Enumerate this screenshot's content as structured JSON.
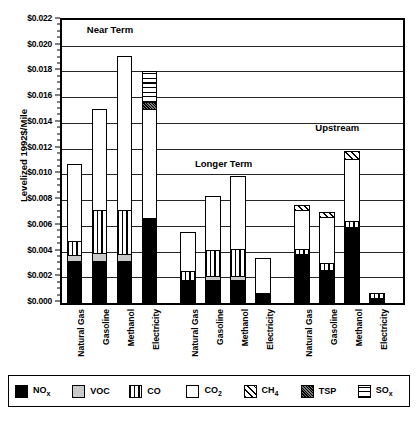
{
  "chart_data": {
    "type": "bar",
    "subtype": "stacked",
    "title": "",
    "xlabel": "",
    "ylabel": "Levelized 1992$/Mile",
    "ylim": [
      0,
      0.022
    ],
    "ytick_step": 0.002,
    "ytick_labels": [
      "$0.000",
      "$0.002",
      "$0.004",
      "$0.006",
      "$0.008",
      "$0.010",
      "$0.012",
      "$0.014",
      "$0.016",
      "$0.018",
      "$0.020",
      "$0.022"
    ],
    "ytick_values": [
      0,
      0.002,
      0.004,
      0.006,
      0.008,
      0.01,
      0.012,
      0.014,
      0.016,
      0.018,
      0.02,
      0.022
    ],
    "grid": true,
    "grid_axis": "y",
    "legend_position": "bottom",
    "categories": [
      "Natural Gas",
      "Gasoline",
      "Methanol",
      "Electricity"
    ],
    "group_labels": [
      "Near Term",
      "Longer Term",
      "Upstream"
    ],
    "series_names": [
      "NOx",
      "VOC",
      "CO",
      "CO2",
      "CH4",
      "TSP",
      "SOx"
    ],
    "series_labels": [
      "NOₓ",
      "VOC",
      "CO",
      "CO₂",
      "CH₄",
      "TSP",
      "SOₓ"
    ],
    "groups": [
      {
        "name": "Near Term",
        "bars": [
          {
            "category": "Natural Gas",
            "total": 0.0108,
            "segments": [
              {
                "series": "NOx",
                "value": 0.0033
              },
              {
                "series": "VOC",
                "value": 0.0004
              },
              {
                "series": "CO",
                "value": 0.0011
              },
              {
                "series": "CO2",
                "value": 0.006
              }
            ]
          },
          {
            "category": "Gasoline",
            "total": 0.0151,
            "segments": [
              {
                "series": "NOx",
                "value": 0.0033
              },
              {
                "series": "VOC",
                "value": 0.0006
              },
              {
                "series": "CO",
                "value": 0.0033
              },
              {
                "series": "CO2",
                "value": 0.0079
              }
            ]
          },
          {
            "category": "Methanol",
            "total": 0.0192,
            "segments": [
              {
                "series": "NOx",
                "value": 0.0033
              },
              {
                "series": "VOC",
                "value": 0.0005
              },
              {
                "series": "CO",
                "value": 0.0034
              },
              {
                "series": "CO2",
                "value": 0.012
              }
            ]
          },
          {
            "category": "Electricity",
            "total": 0.018,
            "segments": [
              {
                "series": "NOx",
                "value": 0.0066
              },
              {
                "series": "CO2",
                "value": 0.0085
              },
              {
                "series": "TSP",
                "value": 0.0005
              },
              {
                "series": "SOx",
                "value": 0.0024
              }
            ]
          }
        ]
      },
      {
        "name": "Longer Term",
        "bars": [
          {
            "category": "Natural Gas",
            "total": 0.0055,
            "segments": [
              {
                "series": "NOx",
                "value": 0.0018
              },
              {
                "series": "CO",
                "value": 0.0007
              },
              {
                "series": "CO2",
                "value": 0.003
              }
            ]
          },
          {
            "category": "Gasoline",
            "total": 0.0083,
            "segments": [
              {
                "series": "NOx",
                "value": 0.0018
              },
              {
                "series": "VOC",
                "value": 0.0003
              },
              {
                "series": "CO",
                "value": 0.002
              },
              {
                "series": "CO2",
                "value": 0.0042
              }
            ]
          },
          {
            "category": "Methanol",
            "total": 0.0099,
            "segments": [
              {
                "series": "NOx",
                "value": 0.0018
              },
              {
                "series": "VOC",
                "value": 0.0003
              },
              {
                "series": "CO",
                "value": 0.0021
              },
              {
                "series": "CO2",
                "value": 0.0057
              }
            ]
          },
          {
            "category": "Electricity",
            "total": 0.0035,
            "segments": [
              {
                "series": "NOx",
                "value": 0.0008
              },
              {
                "series": "CO2",
                "value": 0.0027
              }
            ]
          }
        ]
      },
      {
        "name": "Upstream",
        "bars": [
          {
            "category": "Natural Gas",
            "total": 0.0076,
            "segments": [
              {
                "series": "NOx",
                "value": 0.0038
              },
              {
                "series": "CO",
                "value": 0.0004
              },
              {
                "series": "CO2",
                "value": 0.003
              },
              {
                "series": "CH4",
                "value": 0.0004
              }
            ]
          },
          {
            "category": "Gasoline",
            "total": 0.0071,
            "segments": [
              {
                "series": "NOx",
                "value": 0.0026
              },
              {
                "series": "CO",
                "value": 0.0005
              },
              {
                "series": "CO2",
                "value": 0.0036
              },
              {
                "series": "CH4",
                "value": 0.0004
              }
            ]
          },
          {
            "category": "Methanol",
            "total": 0.0118,
            "segments": [
              {
                "series": "NOx",
                "value": 0.0059
              },
              {
                "series": "CO",
                "value": 0.0005
              },
              {
                "series": "CO2",
                "value": 0.0048
              },
              {
                "series": "CH4",
                "value": 0.0006
              }
            ]
          },
          {
            "category": "Electricity",
            "total": 0.0008,
            "segments": [
              {
                "series": "NOx",
                "value": 0.0004
              },
              {
                "series": "CO",
                "value": 0.0004
              }
            ]
          }
        ]
      }
    ]
  },
  "axis": {
    "y_title": "Levelized 1992$/Mile"
  },
  "legend": {
    "items": [
      {
        "label": "NOₓ",
        "series": "NOx",
        "pattern": "solid-black"
      },
      {
        "label": "VOC",
        "series": "VOC",
        "pattern": "light-gray-dotted"
      },
      {
        "label": "CO",
        "series": "CO",
        "pattern": "vertical-lines"
      },
      {
        "label": "CO₂",
        "series": "CO2",
        "pattern": "white"
      },
      {
        "label": "CH₄",
        "series": "CH4",
        "pattern": "diagonal-hatch"
      },
      {
        "label": "TSP",
        "series": "TSP",
        "pattern": "dark-gray-dense"
      },
      {
        "label": "SOₓ",
        "series": "SOx",
        "pattern": "horizontal-lines"
      }
    ]
  },
  "colors": {
    "nox": "#000000",
    "voc": "#c9c9c9",
    "co": "#ffffff",
    "co2": "#ffffff",
    "ch4": "#ffffff",
    "tsp": "#4a4a4a",
    "sox": "#ffffff",
    "axis": "#000000",
    "background": "#ffffff"
  }
}
